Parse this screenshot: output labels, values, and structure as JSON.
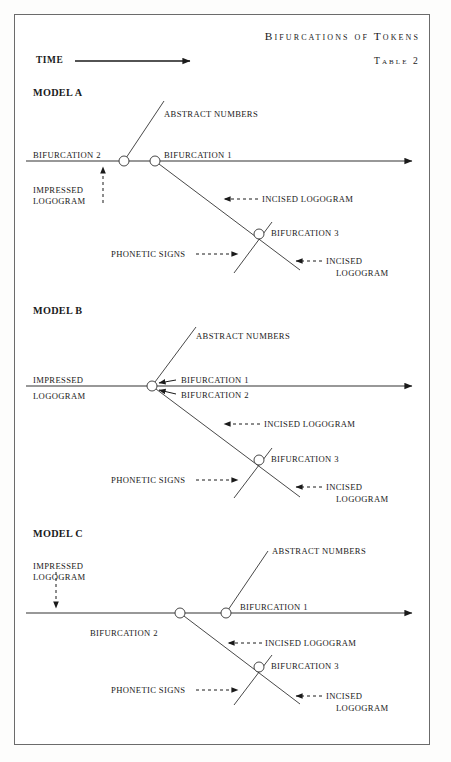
{
  "figure": {
    "title": "Bifurcations of Tokens",
    "table_label": "Table 2",
    "time_axis_label": "TIME"
  },
  "models": [
    {
      "name": "MODEL A",
      "labels": {
        "abstract_numbers": "ABSTRACT NUMBERS",
        "bifurcation_2": "BIFURCATION 2",
        "bifurcation_1": "BIFURCATION 1",
        "impressed_logogram_line1": "IMPRESSED",
        "impressed_logogram_line2": "LOGOGRAM",
        "incised_logogram_upper": "INCISED LOGOGRAM",
        "bifurcation_3": "BIFURCATION 3",
        "phonetic_signs": "PHONETIC SIGNS",
        "incised_logogram_lower_line1": "INCISED",
        "incised_logogram_lower_line2": "LOGOGRAM"
      }
    },
    {
      "name": "MODEL B",
      "labels": {
        "abstract_numbers": "ABSTRACT NUMBERS",
        "impressed_logogram_line1": "IMPRESSED",
        "impressed_logogram_line2": "LOGOGRAM",
        "bifurcation_1": "BIFURCATION 1",
        "bifurcation_2": "BIFURCATION 2",
        "incised_logogram_upper": "INCISED LOGOGRAM",
        "bifurcation_3": "BIFURCATION 3",
        "phonetic_signs": "PHONETIC SIGNS",
        "incised_logogram_lower_line1": "INCISED",
        "incised_logogram_lower_line2": "LOGOGRAM"
      }
    },
    {
      "name": "MODEL C",
      "labels": {
        "abstract_numbers": "ABSTRACT NUMBERS",
        "impressed_logogram_line1": "IMPRESSED",
        "impressed_logogram_line2": "LOGOGRAM",
        "bifurcation_1": "BIFURCATION 1",
        "bifurcation_2": "BIFURCATION 2",
        "incised_logogram_upper": "INCISED LOGOGRAM",
        "bifurcation_3": "BIFURCATION 3",
        "phonetic_signs": "PHONETIC SIGNS",
        "incised_logogram_lower_line1": "INCISED",
        "incised_logogram_lower_line2": "LOGOGRAM"
      }
    }
  ],
  "colors": {
    "ink": "#1a1a1a",
    "line": "#333333",
    "frame": "#6b6b6b",
    "paper": "#ffffff"
  }
}
